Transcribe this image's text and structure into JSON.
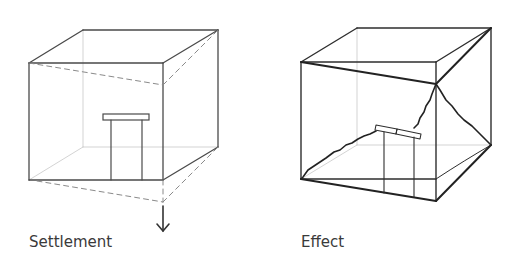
{
  "diagram": {
    "panels": [
      {
        "id": "settlement",
        "label": "Settlement",
        "description": "Cube with door; front-right corner settles downward (dashed displaced outline, down arrow)",
        "colors": {
          "edge": "#444444",
          "hidden": "#bfbfbf",
          "dashed": "#8a8a8a"
        }
      },
      {
        "id": "effect",
        "label": "Effect",
        "description": "Distorted cube with diagonal cracks and broken lintel over door",
        "colors": {
          "edge": "#2a2a2a",
          "hidden": "#bfbfbf"
        }
      }
    ]
  }
}
